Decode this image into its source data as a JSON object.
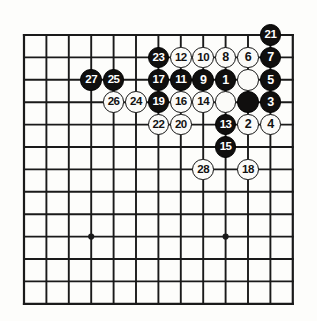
{
  "figure": {
    "kind": "go-board-diagram",
    "title": "",
    "board": {
      "columns": 13,
      "rows": 13,
      "left_px": 24,
      "top_px": 35,
      "spacing_px": 22.4,
      "line_color": "#1a1a1a",
      "edge_line_width_px": 2.2,
      "inner_line_width_px": 1.9,
      "background_color": "#fdfdfb"
    },
    "star_points": [
      {
        "col": 3,
        "row": 9
      },
      {
        "col": 9,
        "row": 9
      }
    ],
    "colors": {
      "black_stone": "#100f0e",
      "white_stone": "#fbfbf9",
      "black_label": "#ffffff",
      "white_label": "#121212",
      "stone_outline": "#131313"
    },
    "stone_diameter_px": 21.5
  },
  "stones": [
    {
      "label": "21",
      "color": "black",
      "col": 11,
      "row": 0
    },
    {
      "label": "23",
      "color": "black",
      "col": 6,
      "row": 1
    },
    {
      "label": "12",
      "color": "white",
      "col": 7,
      "row": 1
    },
    {
      "label": "10",
      "color": "white",
      "col": 8,
      "row": 1
    },
    {
      "label": "8",
      "color": "white",
      "col": 9,
      "row": 1
    },
    {
      "label": "6",
      "color": "white",
      "col": 10,
      "row": 1
    },
    {
      "label": "7",
      "color": "black",
      "col": 11,
      "row": 1
    },
    {
      "label": "27",
      "color": "black",
      "col": 3,
      "row": 2
    },
    {
      "label": "25",
      "color": "black",
      "col": 4,
      "row": 2
    },
    {
      "label": "17",
      "color": "black",
      "col": 6,
      "row": 2
    },
    {
      "label": "11",
      "color": "black",
      "col": 7,
      "row": 2
    },
    {
      "label": "9",
      "color": "black",
      "col": 8,
      "row": 2
    },
    {
      "label": "1",
      "color": "black",
      "col": 9,
      "row": 2
    },
    {
      "label": "",
      "color": "white",
      "col": 10,
      "row": 2
    },
    {
      "label": "5",
      "color": "black",
      "col": 11,
      "row": 2
    },
    {
      "label": "26",
      "color": "white",
      "col": 4,
      "row": 3
    },
    {
      "label": "24",
      "color": "white",
      "col": 5,
      "row": 3
    },
    {
      "label": "19",
      "color": "black",
      "col": 6,
      "row": 3
    },
    {
      "label": "16",
      "color": "white",
      "col": 7,
      "row": 3
    },
    {
      "label": "14",
      "color": "white",
      "col": 8,
      "row": 3
    },
    {
      "label": "",
      "color": "white",
      "col": 9,
      "row": 3
    },
    {
      "label": "",
      "color": "black",
      "col": 10,
      "row": 3
    },
    {
      "label": "3",
      "color": "black",
      "col": 11,
      "row": 3
    },
    {
      "label": "22",
      "color": "white",
      "col": 6,
      "row": 4
    },
    {
      "label": "20",
      "color": "white",
      "col": 7,
      "row": 4
    },
    {
      "label": "13",
      "color": "black",
      "col": 9,
      "row": 4
    },
    {
      "label": "2",
      "color": "white",
      "col": 10,
      "row": 4
    },
    {
      "label": "4",
      "color": "white",
      "col": 11,
      "row": 4
    },
    {
      "label": "15",
      "color": "black",
      "col": 9,
      "row": 5
    },
    {
      "label": "28",
      "color": "white",
      "col": 8,
      "row": 6
    },
    {
      "label": "18",
      "color": "white",
      "col": 10,
      "row": 6
    }
  ]
}
